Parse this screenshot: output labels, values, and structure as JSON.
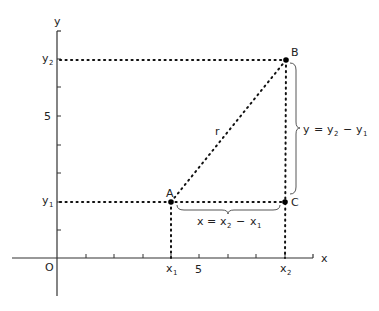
{
  "figure": {
    "axes": {
      "x_label": "x",
      "y_label": "y",
      "origin_label": "O",
      "x_tick_label": "5",
      "y_tick_label": "5",
      "x1_label": "x",
      "x1_sub": "1",
      "x2_label": "x",
      "x2_sub": "2",
      "y1_label": "y",
      "y1_sub": "1",
      "y2_label": "y",
      "y2_sub": "2"
    },
    "points": {
      "A": {
        "label": "A",
        "x": 4,
        "y": 2
      },
      "B": {
        "label": "B",
        "x": 8,
        "y": 7
      },
      "C": {
        "label": "C",
        "x": 8,
        "y": 2
      }
    },
    "segment_label": "r",
    "horizontal_equation": {
      "lhs": "x",
      "eq": "=",
      "t1": "x",
      "t1_sub": "2",
      "minus": "−",
      "t2": "x",
      "t2_sub": "1"
    },
    "vertical_equation": {
      "lhs": "y",
      "eq": "=",
      "t1": "y",
      "t1_sub": "2",
      "minus": "−",
      "t2": "y",
      "t2_sub": "1"
    },
    "colors": {
      "ink": "#222222",
      "background": "#ffffff"
    }
  }
}
